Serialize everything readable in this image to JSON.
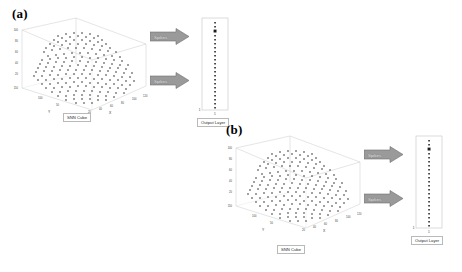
{
  "figure": {
    "panels": [
      {
        "letter": "(a)",
        "cube": {
          "caption": "SNN Cube",
          "axis_labels": {
            "x": "X",
            "y": "Y"
          },
          "z_ticks": [
            "100",
            "80",
            "60",
            "40",
            "20",
            "150"
          ],
          "x_ticks": [
            "20",
            "40",
            "60",
            "80",
            "100",
            "120"
          ],
          "y_ticks": [
            "100",
            "50"
          ]
        },
        "arrows": [
          {
            "label": "Spikes"
          },
          {
            "label": "Spikes"
          }
        ],
        "output_layer": {
          "caption": "Output Layer",
          "left_tick": "1",
          "bottom_tick": "1"
        }
      },
      {
        "letter": "(b)",
        "cube": {
          "caption": "SNN Cube",
          "axis_labels": {
            "x": "X",
            "y": "Y"
          },
          "z_ticks": [
            "100",
            "80",
            "60",
            "40",
            "20",
            "150"
          ],
          "x_ticks": [
            "20",
            "40",
            "60",
            "80",
            "100",
            "120"
          ],
          "y_ticks": [
            "100",
            "50"
          ]
        },
        "arrows": [
          {
            "label": "Spikes"
          },
          {
            "label": "Spikes"
          }
        ],
        "output_layer": {
          "caption": "Output Layer",
          "left_tick": "1",
          "bottom_tick": "1"
        }
      }
    ],
    "colors": {
      "dot": "#141414",
      "frame": "#c9c9c9",
      "arrow_fill": "#9a9a9a",
      "arrow_edge": "#6f6f6f",
      "background": "#ffffff"
    }
  }
}
